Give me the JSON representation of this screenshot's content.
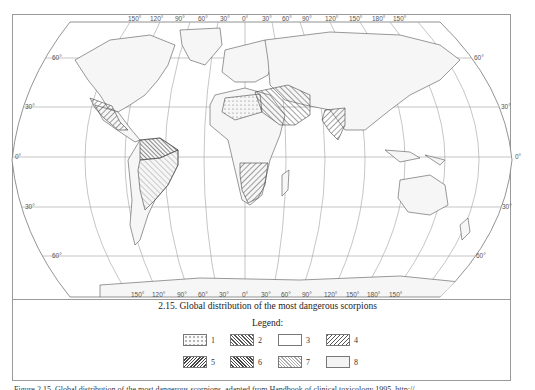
{
  "map": {
    "projection": "Robinson-like world projection",
    "longitude_labels_top": [
      "150°",
      "120°",
      "90°",
      "60°",
      "30°",
      "0°",
      "30°",
      "60°",
      "90°",
      "120°",
      "150°",
      "180°",
      "150°"
    ],
    "longitude_labels_bottom": [
      "150°",
      "120°",
      "90°",
      "60°",
      "30°",
      "0°",
      "30°",
      "60°",
      "90°",
      "120°",
      "150°",
      "180°",
      "150°"
    ],
    "latitude_labels_left": [
      "60°",
      "30°",
      "0°",
      "30°",
      "60°"
    ],
    "latitude_labels_right": [
      "60°",
      "30°",
      "0°",
      "30°",
      "60°"
    ],
    "colors": {
      "land": "#f4f4f4",
      "ocean": "#ffffff",
      "outline": "#555555",
      "grid": "#9a9a9a"
    },
    "regions": [
      {
        "name": "North Africa / Sahara",
        "legend": "1",
        "pattern": "dots"
      },
      {
        "name": "Middle East / Arabia",
        "legend": "2",
        "pattern": "dense-hatch"
      },
      {
        "name": "India",
        "legend": "5",
        "pattern": "diagonal-hatch"
      },
      {
        "name": "Mexico",
        "legend": "4",
        "pattern": "diagonal-hatch"
      },
      {
        "name": "Northern South America",
        "legend": "6",
        "pattern": "dense-backslash-hatch"
      },
      {
        "name": "Brazil / Central South America",
        "legend": "7",
        "pattern": "light-hatch"
      },
      {
        "name": "Southern Africa",
        "legend": "5",
        "pattern": "diagonal-hatch"
      }
    ]
  },
  "caption": "2.15. Global distribution of the most dangerous scorpions",
  "legend": {
    "title": "Legend:",
    "items": [
      {
        "label": "1",
        "pattern": "dots"
      },
      {
        "label": "2",
        "pattern": "backslash-hatch"
      },
      {
        "label": "3",
        "pattern": "blank"
      },
      {
        "label": "4",
        "pattern": "slash-hatch"
      },
      {
        "label": "5",
        "pattern": "slash-hatch-dense"
      },
      {
        "label": "6",
        "pattern": "backslash-hatch-dense"
      },
      {
        "label": "7",
        "pattern": "backslash-hatch-light"
      },
      {
        "label": "8",
        "pattern": "light-fill"
      }
    ]
  },
  "source_line": "Figure 2.15. Global distribution of the most dangerous scorpions. adapted from Handbook of clinical toxicology 1995, http://"
}
